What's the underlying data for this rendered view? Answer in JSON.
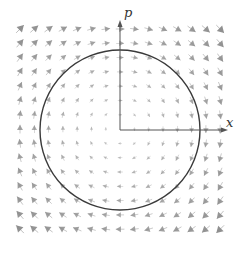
{
  "diagram": {
    "type": "phase-portrait-vector-field",
    "axes": {
      "x_label": "x",
      "y_label": "p",
      "origin_px": [
        120,
        130
      ],
      "x_axis_end_px": 228,
      "y_axis_top_px": 20,
      "color": "#555555"
    },
    "field": {
      "description": "clockwise rotation, dx/dt = p, dp/dt = -x",
      "grid_cols": 15,
      "grid_rows": 15,
      "origin_index": [
        7,
        7
      ],
      "spacing_px": 14.3,
      "start_px": [
        20,
        29
      ],
      "arrow_color": "#8a8a8a",
      "direction": "clockwise"
    },
    "circle": {
      "center_px": [
        120,
        130
      ],
      "radius_px": 80,
      "color": "#3a3a3a"
    }
  }
}
